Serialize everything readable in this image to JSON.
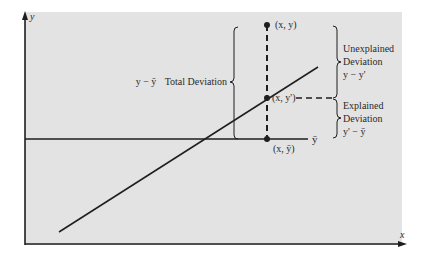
{
  "diagram": {
    "colors": {
      "panel": "#e3e3e3",
      "ink": "#1e1e1e",
      "background": "#ffffff"
    },
    "axes": {
      "x_label": "x",
      "y_label": "y"
    },
    "points": {
      "observed": "(x, y)",
      "predicted": "(x, y')",
      "mean": "(x, ȳ)"
    },
    "mean_line_label": "ȳ",
    "total_deviation": {
      "expr": "y − ȳ",
      "label": "Total Deviation"
    },
    "unexplained": {
      "line1": "Unexplained",
      "line2": "Deviation",
      "expr": "y − y'"
    },
    "explained": {
      "line1": "Explained",
      "line2": "Deviation",
      "expr": "y' − ȳ"
    }
  }
}
